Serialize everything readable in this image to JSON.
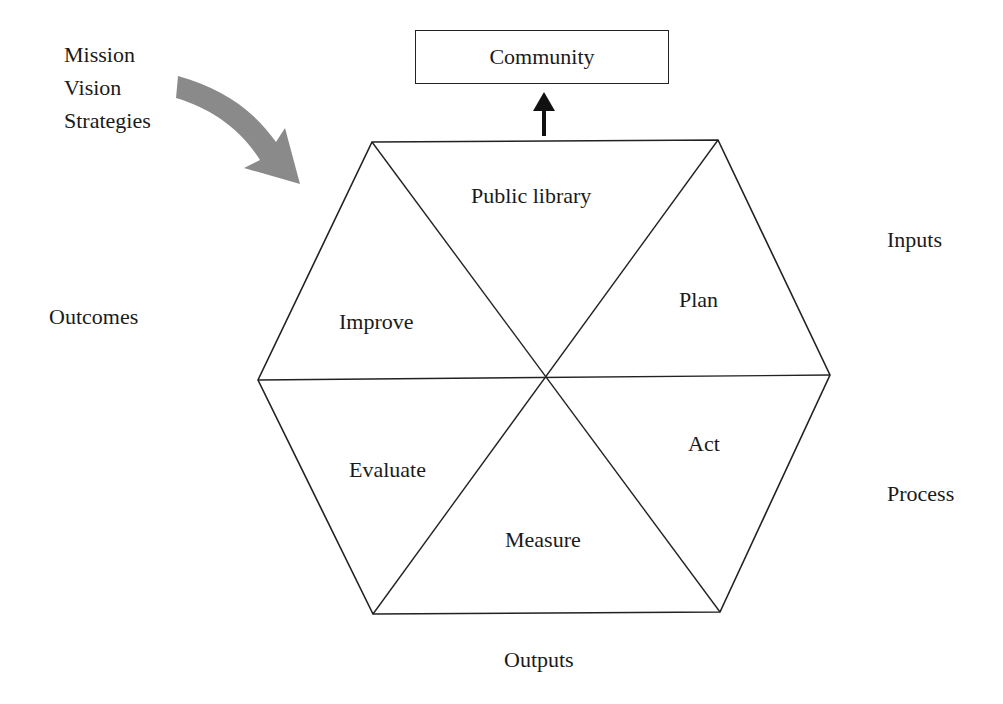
{
  "diagram": {
    "type": "hexagon-cycle",
    "top_box": {
      "label": "Community"
    },
    "drivers": [
      "Mission",
      "Vision",
      "Strategies"
    ],
    "hexagon_segments": {
      "top": "Public library",
      "upper_right": "Plan",
      "lower_right": "Act",
      "bottom": "Measure",
      "lower_left": "Evaluate",
      "upper_left": "Improve"
    },
    "outer_labels": {
      "left": "Outcomes",
      "upper_right": "Inputs",
      "lower_right": "Process",
      "bottom": "Outputs"
    },
    "colors": {
      "line": "#222222",
      "curved_arrow": "#8a8a8a",
      "background": "#ffffff"
    }
  }
}
